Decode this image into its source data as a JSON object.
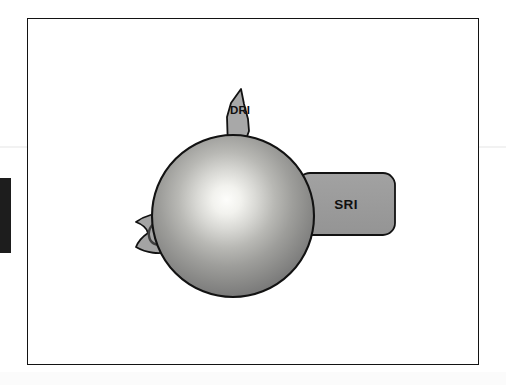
{
  "figure": {
    "background_color": "#ffffff",
    "frame_color": "#131313",
    "shapes": {
      "sphere": {
        "name": "central-sphere",
        "center_x": 232,
        "center_y": 215,
        "radius": 81,
        "highlight_color": "#fdfdfb",
        "mid_color": "#9a9a9a",
        "edge_color": "#6d6d6d",
        "outline_color": "#121212"
      },
      "dri_spike": {
        "name": "dri-spike",
        "label": "DRI",
        "fill_color": "#a8a8a8",
        "outline_color": "#121212"
      },
      "sri_block": {
        "name": "sri-block",
        "label": "SRI",
        "fill_color": "#9c9c9c",
        "outline_color": "#121212",
        "x": 297,
        "y": 172,
        "width": 97,
        "height": 62,
        "corner_radius": 12
      },
      "left_leaf": {
        "name": "left-leaf-organelle",
        "glyph": "σ",
        "fill_color": "#a4a4a4",
        "outline_color": "#121212"
      }
    }
  },
  "artifacts": {
    "left_edge_mark_color": "#1d1d1d"
  }
}
